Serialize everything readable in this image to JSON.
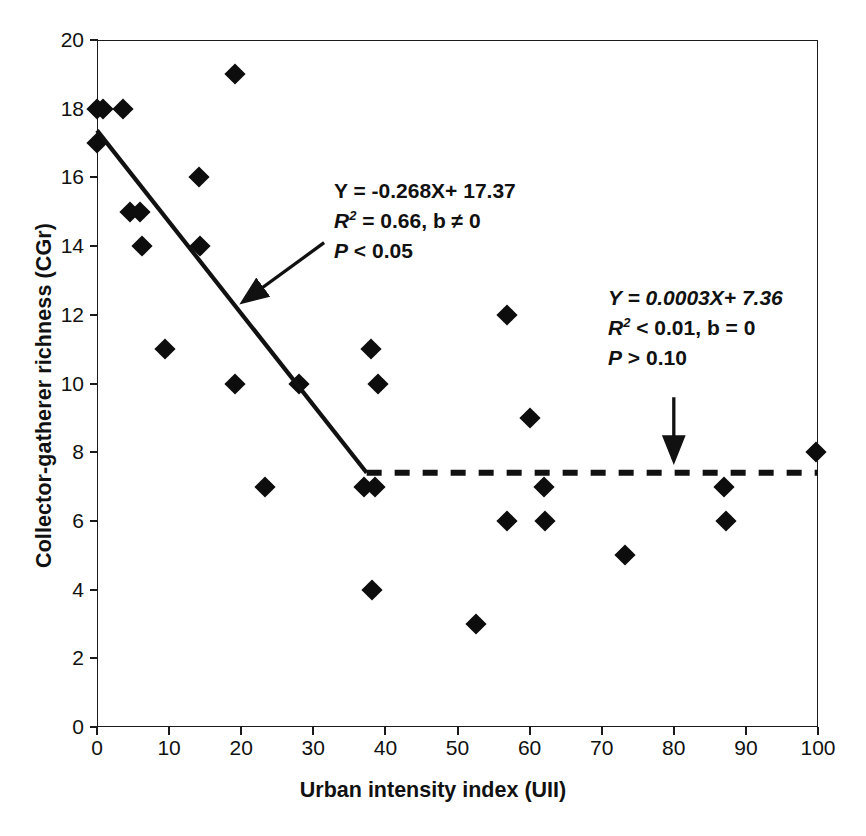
{
  "chart_data": {
    "type": "scatter",
    "title": "",
    "xlabel": "Urban intensity index (UII)",
    "ylabel": "Collector-gatherer richness (CGr)",
    "xlim": [
      0,
      100
    ],
    "ylim": [
      0,
      20
    ],
    "xticks": [
      0,
      10,
      20,
      30,
      40,
      50,
      60,
      70,
      80,
      90,
      100
    ],
    "yticks": [
      0,
      2,
      4,
      6,
      8,
      10,
      12,
      14,
      16,
      18,
      20
    ],
    "grid": false,
    "legend": "none",
    "marker": "filled-diamond",
    "marker_color": "#0d0d0d",
    "points": [
      {
        "x": 0.0,
        "y": 18
      },
      {
        "x": 0.8,
        "y": 18
      },
      {
        "x": 3.6,
        "y": 18
      },
      {
        "x": 0.0,
        "y": 17
      },
      {
        "x": 14.2,
        "y": 16
      },
      {
        "x": 4.6,
        "y": 15
      },
      {
        "x": 6.0,
        "y": 15
      },
      {
        "x": 6.3,
        "y": 14
      },
      {
        "x": 14.3,
        "y": 14
      },
      {
        "x": 19.2,
        "y": 19
      },
      {
        "x": 9.5,
        "y": 11
      },
      {
        "x": 19.2,
        "y": 10
      },
      {
        "x": 28.0,
        "y": 10
      },
      {
        "x": 23.3,
        "y": 7
      },
      {
        "x": 37.0,
        "y": 7
      },
      {
        "x": 38.6,
        "y": 7
      },
      {
        "x": 38.0,
        "y": 11
      },
      {
        "x": 39.0,
        "y": 10
      },
      {
        "x": 38.2,
        "y": 4
      },
      {
        "x": 52.6,
        "y": 3
      },
      {
        "x": 56.8,
        "y": 12
      },
      {
        "x": 56.8,
        "y": 6
      },
      {
        "x": 60.0,
        "y": 9
      },
      {
        "x": 62.0,
        "y": 7
      },
      {
        "x": 62.2,
        "y": 6
      },
      {
        "x": 73.3,
        "y": 5
      },
      {
        "x": 87.0,
        "y": 7
      },
      {
        "x": 87.2,
        "y": 6
      },
      {
        "x": 99.7,
        "y": 8
      }
    ],
    "series": [
      {
        "name": "declining-regression-line",
        "style": "solid",
        "equation": "Y = -0.268X+ 17.37",
        "x_start": 0.0,
        "y_start": 17.37,
        "x_end": 37.4,
        "y_end": 7.4
      },
      {
        "name": "flat-regression-line",
        "style": "dashed",
        "equation": "Y = 0.0003X+ 7.36",
        "x_start": 37.4,
        "y_start": 7.4,
        "x_end": 100.0,
        "y_end": 7.4
      }
    ],
    "annotations": [
      {
        "id": "left-annotation",
        "line1": "Y = -0.268X+ 17.37",
        "line2_prefix": "R",
        "line2_sup": "2",
        "line2_rest": " =  0.66, b ≠ 0",
        "line3": "P < 0.05",
        "arrow_from": {
          "x": 31.5,
          "y": 14.1
        },
        "arrow_to": {
          "x": 20.4,
          "y": 12.4
        }
      },
      {
        "id": "right-annotation",
        "line1": "Y = 0.0003X+ 7.36",
        "line2_prefix": "R",
        "line2_sup": "2",
        "line2_rest": " < 0.01, b = 0",
        "line3": "P > 0.10",
        "arrow_from": {
          "x": 80.0,
          "y": 9.6
        },
        "arrow_to": {
          "x": 80.0,
          "y": 7.8
        }
      }
    ]
  },
  "axes": {
    "y_tick_labels": [
      "20",
      "18",
      "16",
      "14",
      "12",
      "10",
      "8",
      "6",
      "4",
      "2",
      "0"
    ],
    "x_tick_labels": [
      "0",
      "10",
      "20",
      "30",
      "40",
      "50",
      "60",
      "70",
      "80",
      "90",
      "100"
    ],
    "x_title": "Urban intensity index (UII)",
    "y_title": "Collector-gatherer richness (CGr)"
  },
  "annotation_left": {
    "line1": "Y = -0.268X+ 17.37",
    "line2_r": "R",
    "line2_sup": "2",
    "line2_tail": " =  0.66, b ≠ 0",
    "line3_p": "P",
    "line3_tail": " < 0.05"
  },
  "annotation_right": {
    "line1": "Y = 0.0003X+ 7.36",
    "line2_r": "R",
    "line2_sup": "2",
    "line2_tail": " < 0.01, b = 0",
    "line3_p": "P",
    "line3_tail": " > 0.10"
  }
}
